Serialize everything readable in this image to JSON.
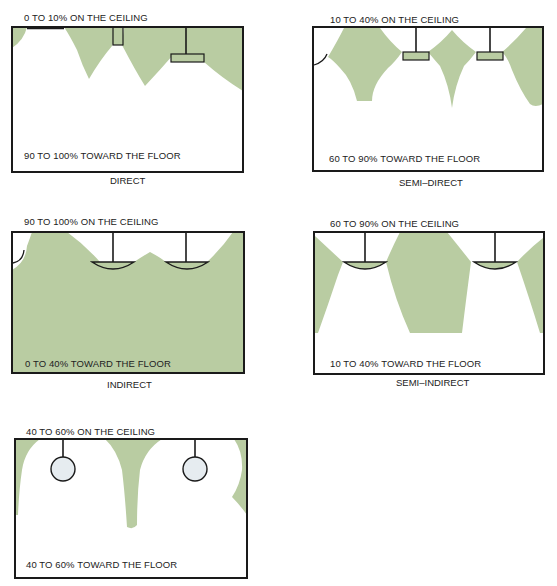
{
  "colors": {
    "light_fill": "#b9cca2",
    "frame": "#1a1a1a",
    "globe_fill": "#e6ecf0"
  },
  "panels": [
    {
      "id": "direct",
      "ceiling_label": "0 TO 10% ON THE CEILING",
      "floor_label": "90 TO 100% TOWARD THE FLOOR",
      "caption": "DIRECT"
    },
    {
      "id": "semi-direct",
      "ceiling_label": "10 TO 40% ON THE CEILING",
      "floor_label": "60 TO 90% TOWARD THE FLOOR",
      "caption": "SEMI–DIRECT"
    },
    {
      "id": "indirect",
      "ceiling_label": "90 TO 100% ON THE CEILING",
      "floor_label": "0 TO 40% TOWARD THE FLOOR",
      "caption": "INDIRECT"
    },
    {
      "id": "semi-indirect",
      "ceiling_label": "60 TO 90% ON THE CEILING",
      "floor_label": "10 TO 40% TOWARD THE FLOOR",
      "caption": "SEMI–INDIRECT"
    },
    {
      "id": "general-diffuse",
      "ceiling_label": "40 TO 60% ON THE CEILING",
      "floor_label": "40 TO 60% TOWARD THE FLOOR",
      "caption": ""
    }
  ]
}
